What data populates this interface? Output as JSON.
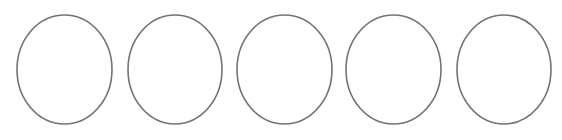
{
  "diagram": {
    "background": "#ffffff",
    "stroke_color": "#737373",
    "stroke_width": 1.6,
    "fill": "#ffffff",
    "shapes": [
      {
        "type": "ellipse",
        "cx": 64.5,
        "cy": 69.5,
        "rx": 47.5,
        "ry": 54.5
      },
      {
        "type": "ellipse",
        "cx": 175,
        "cy": 69.5,
        "rx": 47,
        "ry": 54.5
      },
      {
        "type": "ellipse",
        "cx": 284.5,
        "cy": 69.5,
        "rx": 47.5,
        "ry": 54.5
      },
      {
        "type": "ellipse",
        "cx": 393.5,
        "cy": 69.5,
        "rx": 47.5,
        "ry": 54.5
      },
      {
        "type": "ellipse",
        "cx": 504,
        "cy": 69.5,
        "rx": 47,
        "ry": 54.5
      }
    ]
  }
}
